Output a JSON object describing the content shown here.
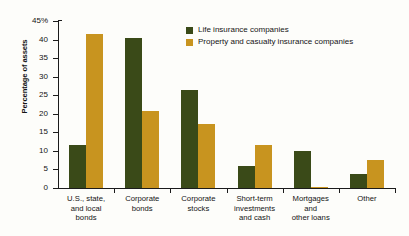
{
  "chart_data": {
    "type": "bar",
    "title": "",
    "xlabel": "",
    "ylabel": "Percentage of assets",
    "ylim": [
      0,
      45
    ],
    "ytick_labels": [
      "45%",
      "40",
      "35",
      "30",
      "25",
      "20",
      "15",
      "10",
      "5",
      "0"
    ],
    "ytick_values": [
      45,
      40,
      35,
      30,
      25,
      20,
      15,
      10,
      5,
      0
    ],
    "grid": false,
    "legend_position": "top-right-inside",
    "categories": [
      "U.S., state, and local bonds",
      "Corporate bonds",
      "Corporate stocks",
      "Short-term investments and cash",
      "Mortgages and other loans",
      "Other"
    ],
    "category_label_lines": [
      [
        "U.S., state,",
        "and local",
        "bonds"
      ],
      [
        "Corporate",
        "bonds"
      ],
      [
        "Corporate",
        "stocks"
      ],
      [
        "Short-term",
        "investments",
        "and cash"
      ],
      [
        "Mortgages",
        "and",
        "other loans"
      ],
      [
        "Other"
      ]
    ],
    "series": [
      {
        "name": "Life insurance companies",
        "color": "#3a4a18",
        "values": [
          11.5,
          40.3,
          26.3,
          6.0,
          10.0,
          3.7
        ]
      },
      {
        "name": "Property and casualty insurance companies",
        "color": "#c8941f",
        "values": [
          41.5,
          20.8,
          17.3,
          11.6,
          0.4,
          7.5
        ]
      }
    ]
  },
  "legend": {
    "items": [
      {
        "label": "Life insurance companies",
        "color": "#3a4a18"
      },
      {
        "label": "Property and casualty insurance companies",
        "color": "#c8941f"
      }
    ]
  },
  "axis": {
    "y_title": "Percentage of assets"
  }
}
